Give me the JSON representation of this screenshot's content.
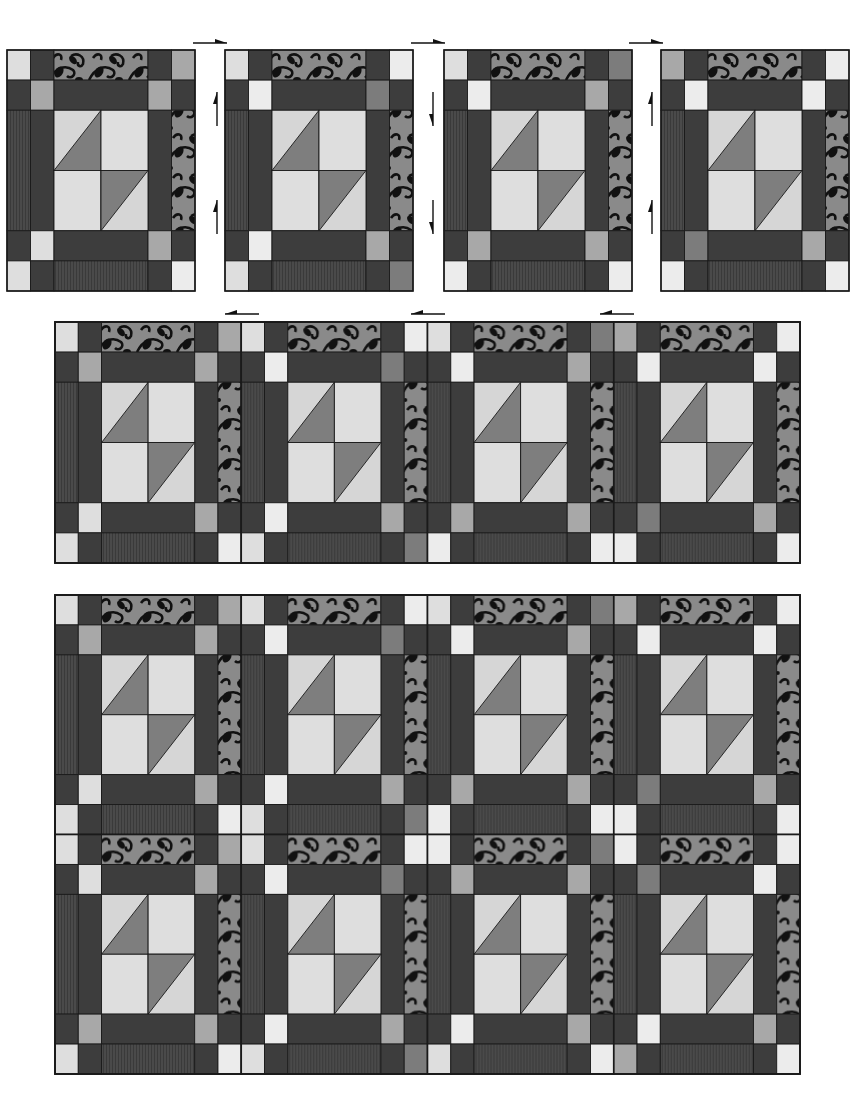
{
  "colors": {
    "dark": "#3d3d3d",
    "dark_stripe": "#4a4a4a",
    "print_bg": "#8a8a8a",
    "print_ink": "#111111",
    "light": "#dedede",
    "lighter": "#ececec",
    "mid": "#a8a8a8",
    "mid_dark": "#7c7c7c",
    "hst_dark": "#7e7e7e",
    "hst_light": "#d6d6d6",
    "outline": "#1a1a1a"
  },
  "block_grid": {
    "cols": [
      23,
      23,
      46,
      46,
      23,
      23
    ],
    "rows": [
      30,
      30,
      60,
      60,
      30,
      30
    ]
  },
  "step1": {
    "label": "Step 1: individual blocks",
    "block_width": 188,
    "block_height": 241,
    "top": 50,
    "blocks": [
      {
        "x": 7,
        "corner_tl": "light",
        "corner_tr": "mid",
        "inner_tl": "mid",
        "inner_tr": "mid",
        "inner_bl": "light",
        "inner_br": "mid",
        "corner_bl": "light",
        "corner_br": "lighter"
      },
      {
        "x": 225,
        "corner_tl": "light",
        "corner_tr": "lighter",
        "inner_tl": "lighter",
        "inner_tr": "mid_dark",
        "inner_bl": "lighter",
        "inner_br": "mid",
        "corner_bl": "light",
        "corner_br": "mid_dark"
      },
      {
        "x": 444,
        "corner_tl": "light",
        "corner_tr": "mid_dark",
        "inner_tl": "lighter",
        "inner_tr": "mid",
        "inner_bl": "mid",
        "inner_br": "mid",
        "corner_bl": "lighter",
        "corner_br": "lighter"
      },
      {
        "x": 661,
        "corner_tl": "mid",
        "corner_tr": "lighter",
        "inner_tl": "lighter",
        "inner_tr": "lighter",
        "inner_bl": "mid_dark",
        "inner_br": "mid",
        "corner_bl": "lighter",
        "corner_br": "lighter"
      }
    ],
    "arrows_right": [
      {
        "x": 193,
        "y": 43
      },
      {
        "x": 411,
        "y": 43
      },
      {
        "x": 629,
        "y": 43
      }
    ],
    "arrows_vertical": [
      {
        "x": 217,
        "y": 92,
        "dir": "up"
      },
      {
        "x": 217,
        "y": 200,
        "dir": "up"
      },
      {
        "x": 433,
        "y": 92,
        "dir": "down"
      },
      {
        "x": 433,
        "y": 200,
        "dir": "down"
      },
      {
        "x": 652,
        "y": 92,
        "dir": "up"
      },
      {
        "x": 652,
        "y": 200,
        "dir": "up"
      }
    ]
  },
  "step2": {
    "label": "Step 2: row of four blocks",
    "x": 55,
    "y": 322,
    "width": 745,
    "height": 241,
    "arrows_left": [
      {
        "x": 225,
        "y": 314
      },
      {
        "x": 411,
        "y": 314
      },
      {
        "x": 600,
        "y": 314
      }
    ]
  },
  "step3": {
    "label": "Step 3: two rows joined",
    "x": 55,
    "y": 595,
    "width": 745,
    "height": 479,
    "rows": 2
  }
}
